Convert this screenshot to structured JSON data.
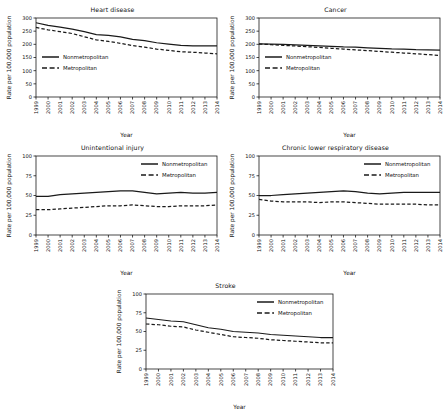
{
  "figure": {
    "layout": "five-panel small multiples, 2x2 grid plus centered bottom panel",
    "background_color": "#ffffff",
    "line_color": "#1a1a1a",
    "axis_color": "#1a1a1a"
  },
  "chart_data": [
    {
      "type": "line",
      "title": "Heart disease",
      "xlabel": "Year",
      "ylabel": "Rate per 100,000 population",
      "x": [
        1999,
        2000,
        2001,
        2002,
        2003,
        2004,
        2005,
        2006,
        2007,
        2008,
        2009,
        2010,
        2011,
        2012,
        2013,
        2014
      ],
      "xtick_labels": [
        "1999",
        "2000",
        "2001",
        "2002",
        "2003",
        "2004",
        "2005",
        "2006",
        "2007",
        "2008",
        "2009",
        "2010",
        "2011",
        "2012",
        "2013",
        "2014"
      ],
      "ylim": [
        0,
        300
      ],
      "yticks": [
        0,
        50,
        100,
        150,
        200,
        250,
        300
      ],
      "grid": false,
      "legend_position": "inside-left",
      "series": [
        {
          "name": "Nonmetropolitan",
          "style": "solid",
          "values": [
            282,
            272,
            265,
            258,
            248,
            237,
            234,
            228,
            219,
            214,
            206,
            201,
            196,
            194,
            194,
            194
          ]
        },
        {
          "name": "Metropolitan",
          "style": "dashed",
          "values": [
            264,
            255,
            248,
            241,
            229,
            217,
            211,
            204,
            195,
            189,
            182,
            177,
            172,
            170,
            167,
            164
          ]
        }
      ]
    },
    {
      "type": "line",
      "title": "Cancer",
      "xlabel": "Year",
      "ylabel": "Rate per 100,000 population",
      "x": [
        1999,
        2000,
        2001,
        2002,
        2003,
        2004,
        2005,
        2006,
        2007,
        2008,
        2009,
        2010,
        2011,
        2012,
        2013,
        2014
      ],
      "xtick_labels": [
        "1999",
        "2000",
        "2001",
        "2002",
        "2003",
        "2004",
        "2005",
        "2006",
        "2007",
        "2008",
        "2009",
        "2010",
        "2011",
        "2012",
        "2013",
        "2014"
      ],
      "ylim": [
        0,
        300
      ],
      "yticks": [
        0,
        50,
        100,
        150,
        200,
        250,
        300
      ],
      "grid": false,
      "legend_position": "inside-left",
      "series": [
        {
          "name": "Nonmetropolitan",
          "style": "solid",
          "values": [
            202,
            201,
            200,
            198,
            196,
            194,
            192,
            190,
            189,
            187,
            185,
            183,
            182,
            180,
            179,
            178
          ]
        },
        {
          "name": "Metropolitan",
          "style": "dashed",
          "values": [
            201,
            199,
            196,
            194,
            191,
            188,
            185,
            182,
            179,
            176,
            173,
            170,
            167,
            164,
            161,
            158
          ]
        }
      ]
    },
    {
      "type": "line",
      "title": "Unintentional injury",
      "xlabel": "Year",
      "ylabel": "Rate per 100,000 population",
      "x": [
        1999,
        2000,
        2001,
        2002,
        2003,
        2004,
        2005,
        2006,
        2007,
        2008,
        2009,
        2010,
        2011,
        2012,
        2013,
        2014
      ],
      "xtick_labels": [
        "1999",
        "2000",
        "2001",
        "2002",
        "2003",
        "2004",
        "2005",
        "2006",
        "2007",
        "2008",
        "2009",
        "2010",
        "2011",
        "2012",
        "2013",
        "2014"
      ],
      "ylim": [
        0,
        100
      ],
      "yticks": [
        0,
        25,
        50,
        75,
        100
      ],
      "grid": false,
      "legend_position": "inside-right",
      "series": [
        {
          "name": "Nonmetropolitan",
          "style": "solid",
          "values": [
            49,
            49,
            51,
            52,
            53,
            54,
            55,
            56,
            56,
            54,
            52,
            53,
            54,
            53,
            53,
            54
          ]
        },
        {
          "name": "Metropolitan",
          "style": "dashed",
          "values": [
            32,
            32,
            33,
            34,
            35,
            36,
            37,
            37,
            38,
            37,
            36,
            36,
            37,
            37,
            37,
            38
          ]
        }
      ]
    },
    {
      "type": "line",
      "title": "Chronic lower respiratory disease",
      "xlabel": "Year",
      "ylabel": "Rate per 100,000 population",
      "x": [
        1999,
        2000,
        2001,
        2002,
        2003,
        2004,
        2005,
        2006,
        2007,
        2008,
        2009,
        2010,
        2011,
        2012,
        2013,
        2014
      ],
      "xtick_labels": [
        "1999",
        "2000",
        "2001",
        "2002",
        "2003",
        "2004",
        "2005",
        "2006",
        "2007",
        "2008",
        "2009",
        "2010",
        "2011",
        "2012",
        "2013",
        "2014"
      ],
      "ylim": [
        0,
        100
      ],
      "yticks": [
        0,
        25,
        50,
        75,
        100
      ],
      "grid": false,
      "legend_position": "inside-right",
      "series": [
        {
          "name": "Nonmetropolitan",
          "style": "solid",
          "values": [
            50,
            50,
            51,
            52,
            53,
            54,
            55,
            56,
            55,
            53,
            52,
            53,
            54,
            54,
            54,
            54
          ]
        },
        {
          "name": "Metropolitan",
          "style": "dashed",
          "values": [
            45,
            43,
            42,
            42,
            42,
            41,
            42,
            42,
            41,
            40,
            39,
            39,
            39,
            39,
            38,
            38
          ]
        }
      ]
    },
    {
      "type": "line",
      "title": "Stroke",
      "xlabel": "Year",
      "ylabel": "Rate per 100,000 population",
      "x": [
        1999,
        2000,
        2001,
        2002,
        2003,
        2004,
        2005,
        2006,
        2007,
        2008,
        2009,
        2010,
        2011,
        2012,
        2013,
        2014
      ],
      "xtick_labels": [
        "1999",
        "2000",
        "2001",
        "2002",
        "2003",
        "2004",
        "2005",
        "2006",
        "2007",
        "2008",
        "2009",
        "2010",
        "2011",
        "2012",
        "2013",
        "2014"
      ],
      "ylim": [
        0,
        100
      ],
      "yticks": [
        0,
        25,
        50,
        75,
        100
      ],
      "grid": false,
      "legend_position": "inside-right",
      "series": [
        {
          "name": "Nonmetropolitan",
          "style": "solid",
          "values": [
            68,
            66,
            64,
            63,
            59,
            55,
            53,
            50,
            49,
            48,
            46,
            45,
            44,
            43,
            42,
            42
          ]
        },
        {
          "name": "Metropolitan",
          "style": "dashed",
          "values": [
            60,
            59,
            57,
            56,
            52,
            49,
            46,
            43,
            42,
            41,
            39,
            38,
            37,
            36,
            35,
            35
          ]
        }
      ]
    }
  ]
}
